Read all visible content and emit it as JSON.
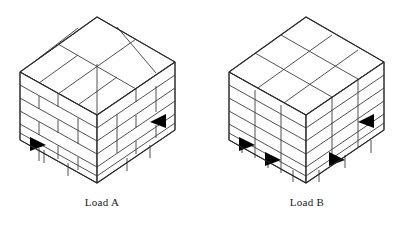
{
  "figure": {
    "background_color": "#ffffff",
    "line_color": "#3d3d3d",
    "notch_color": "#000000",
    "caption_color": "#1a1a1a"
  },
  "loads": [
    {
      "id": "load-a",
      "caption": "Load A",
      "pattern": "interlocked",
      "pattern_description": "Bricks staggered / pinwheel interlocked between courses",
      "box_layers": 5,
      "visible_pallet_notches": 2,
      "top_face_pattern": "pinwheel",
      "column_lines_continuous": false
    },
    {
      "id": "load-b",
      "caption": "Load B",
      "pattern": "columnar",
      "pattern_description": "Boxes stacked in aligned vertical columns",
      "box_layers": 5,
      "visible_pallet_notches": 4,
      "top_face_pattern": "grid",
      "column_lines_continuous": true
    }
  ]
}
